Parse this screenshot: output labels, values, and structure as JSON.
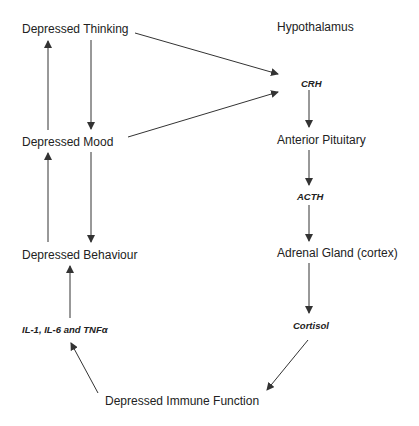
{
  "diagram": {
    "left_column": {
      "thinking": "Depressed Thinking",
      "mood": "Depressed Mood",
      "behaviour": "Depressed Behaviour",
      "cytokines": "IL-1, IL-6 and TNFα"
    },
    "right_column": {
      "hypothalamus": "Hypothalamus",
      "crh": "CRH",
      "pituitary": "Anterior Pituitary",
      "acth": "ACTH",
      "adrenal": "Adrenal Gland (cortex)",
      "cortisol": "Cortisol"
    },
    "bottom": {
      "immune": "Depressed Immune Function"
    },
    "colors": {
      "text": "#222222",
      "line": "#333333",
      "background": "#ffffff"
    }
  }
}
